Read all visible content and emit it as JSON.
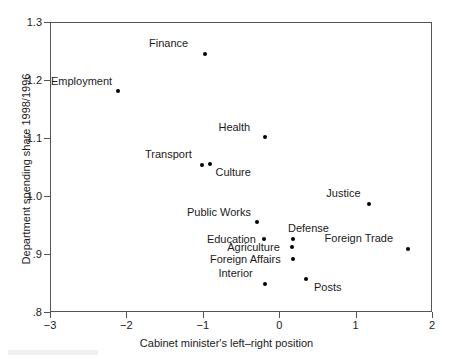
{
  "chart_data": {
    "type": "scatter",
    "title": "",
    "xlabel": "Cabinet minister's left–right position",
    "ylabel": "Department spending share 1998/1996",
    "xlim": [
      -3,
      2
    ],
    "ylim": [
      0.8,
      1.3
    ],
    "xticks": [
      "−3",
      "−2",
      "−1",
      "0",
      "1",
      "2"
    ],
    "xtick_values": [
      -3,
      -2,
      -1,
      0,
      1,
      2
    ],
    "yticks": [
      "1.3",
      "1.2",
      "1.1",
      "1.0",
      ".9",
      ".8"
    ],
    "ytick_values": [
      1.3,
      1.2,
      1.1,
      1.0,
      0.9,
      0.8
    ],
    "grid": false,
    "legend": "none",
    "marker": "filled-circle",
    "marker_color": "#000000",
    "points": [
      {
        "label": "Finance",
        "x": -0.97,
        "y": 1.245,
        "label_dx": -56,
        "label_dy": -16
      },
      {
        "label": "Employment",
        "x": -2.11,
        "y": 1.181,
        "label_dx": -67,
        "label_dy": -15
      },
      {
        "label": "Health",
        "x": -0.18,
        "y": 1.102,
        "label_dx": -47,
        "label_dy": -15
      },
      {
        "label": "Transport",
        "x": -1.01,
        "y": 1.054,
        "label_dx": -57,
        "label_dy": -16
      },
      {
        "label": "Culture",
        "x": -0.9,
        "y": 1.055,
        "label_dx": 5,
        "label_dy": 3
      },
      {
        "label": "Justice",
        "x": 1.18,
        "y": 0.986,
        "label_dx": -43,
        "label_dy": -16
      },
      {
        "label": "Public Works",
        "x": -0.29,
        "y": 0.955,
        "label_dx": -70,
        "label_dy": -15
      },
      {
        "label": "Education",
        "x": -0.2,
        "y": 0.926,
        "label_dx": -57,
        "label_dy": -5
      },
      {
        "label": "Defense",
        "x": 0.18,
        "y": 0.926,
        "label_dx": -5,
        "label_dy": -16
      },
      {
        "label": "Agriculture",
        "x": 0.17,
        "y": 0.912,
        "label_dx": -65,
        "label_dy": -5
      },
      {
        "label": "Foreign Trade",
        "x": 1.68,
        "y": 0.909,
        "label_dx": -83,
        "label_dy": -16
      },
      {
        "label": "Foreign Affairs",
        "x": 0.18,
        "y": 0.892,
        "label_dx": -83,
        "label_dy": -5
      },
      {
        "label": "Posts",
        "x": 0.35,
        "y": 0.857,
        "label_dx": 8,
        "label_dy": 3
      },
      {
        "label": "Interior",
        "x": -0.18,
        "y": 0.848,
        "label_dx": -47,
        "label_dy": -16
      }
    ]
  }
}
